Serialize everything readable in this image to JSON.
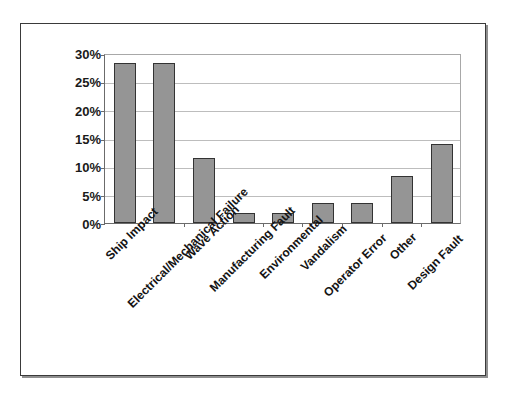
{
  "chart_data": {
    "type": "bar",
    "title": "",
    "subtitle": "",
    "xlabel": "",
    "ylabel": "",
    "grid": true,
    "legend": false,
    "legend_position": "none",
    "ylim": [
      0,
      30
    ],
    "ytick_labels": [
      "30%",
      "25%",
      "20%",
      "15%",
      "10%",
      "5%",
      "0%"
    ],
    "ytick_values": [
      30,
      25,
      20,
      15,
      10,
      5,
      0
    ],
    "categories": [
      "Ship Impact",
      "Electrical/Mechanical Failure",
      "Wave Action",
      "Manufacturing Fault",
      "Environmental",
      "Vandalism",
      "Operator Error",
      "Other",
      "Design Fault"
    ],
    "values": [
      28.3,
      28.3,
      11.5,
      1.8,
      1.8,
      3.5,
      3.5,
      8.3,
      14.0
    ],
    "value_labels": [
      "28.3%",
      "28.3%",
      "11.5%",
      "1.8%",
      "1.8%",
      "3.5%",
      "3.5%",
      "8.3%",
      "14.0%"
    ],
    "series": [
      {
        "name": "Failure cause share",
        "values": [
          28.3,
          28.3,
          11.5,
          1.8,
          1.8,
          3.5,
          3.5,
          8.3,
          14.0
        ]
      }
    ],
    "colors": {
      "bar_fill": "#959595",
      "bar_border": "#333333",
      "gridline": "#bdbdbd",
      "axis": "#6b6b6b",
      "frame": "#3a3a3a",
      "text": "#141414",
      "background": "#ffffff"
    }
  }
}
